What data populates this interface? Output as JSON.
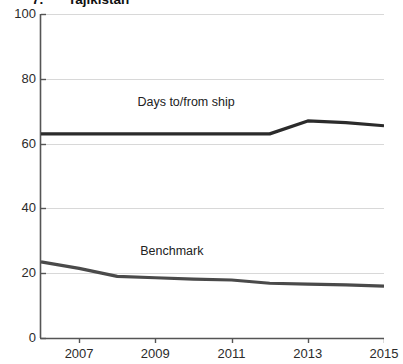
{
  "title": {
    "number": "7.",
    "name": "Tajikistan"
  },
  "chart_data": {
    "type": "line",
    "title": "7. Tajikistan",
    "xlabel": "",
    "ylabel": "",
    "xlim": [
      2006,
      2015
    ],
    "ylim": [
      0,
      100
    ],
    "yticks": [
      0,
      20,
      40,
      60,
      80,
      100
    ],
    "xticks": [
      2007,
      2009,
      2011,
      2013,
      2015
    ],
    "xtick_labels": [
      "2007",
      "2009",
      "2011",
      "2013",
      "2015"
    ],
    "ytick_labels": [
      "0",
      "20",
      "40",
      "60",
      "80",
      "100"
    ],
    "grid": true,
    "grid_axis": "y",
    "legend": "inline-annotations",
    "x": [
      2006,
      2007,
      2008,
      2009,
      2010,
      2011,
      2012,
      2013,
      2014,
      2015
    ],
    "series": [
      {
        "name": "Days to/from ship",
        "color": "#2b2b2b",
        "values": [
          63.0,
          63.0,
          63.0,
          63.0,
          63.0,
          63.0,
          63.0,
          67.0,
          66.5,
          65.5
        ],
        "annotation": {
          "text": "Days to/from ship",
          "x": 2010.0,
          "y": 72.5
        }
      },
      {
        "name": "Benchmark",
        "color": "#4a4a4a",
        "values": [
          23.5,
          21.5,
          19.0,
          18.6,
          18.2,
          17.9,
          16.9,
          16.6,
          16.4,
          16.0
        ],
        "annotation": {
          "text": "Benchmark",
          "x": 2009.6,
          "y": 26.5
        }
      }
    ]
  },
  "axes": {
    "y_labels": [
      "100",
      "80",
      "60",
      "40",
      "20",
      "0"
    ],
    "x_labels": [
      "2007",
      "2009",
      "2011",
      "2013",
      "2015"
    ]
  },
  "annotations": {
    "upper": "Days to/from ship",
    "lower": "Benchmark"
  },
  "colors": {
    "line_upper": "#2b2b2b",
    "line_lower": "#4a4a4a",
    "axis": "#555555",
    "grid": "#d8d8d8",
    "background": "#ffffff"
  }
}
